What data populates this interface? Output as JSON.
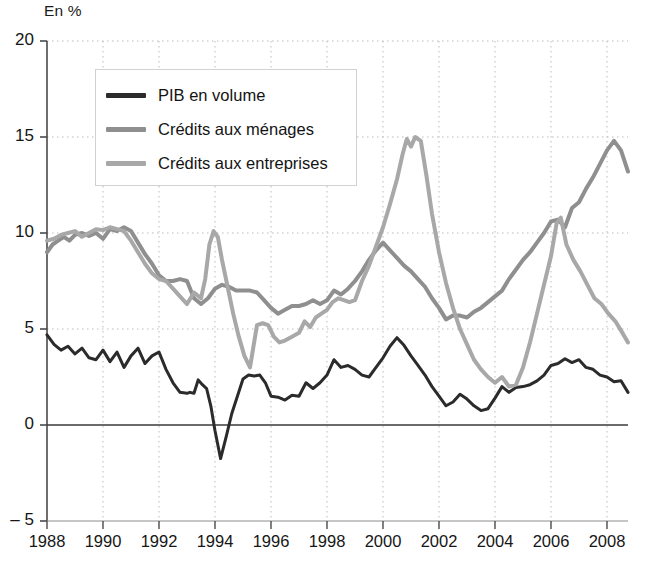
{
  "axis_unit_label": "En %",
  "legend": {
    "items": [
      {
        "label": "PIB en volume",
        "color": "#2b2b2b"
      },
      {
        "label": "Crédits aux ménages",
        "color": "#8f8f8f"
      },
      {
        "label": "Crédits aux entreprises",
        "color": "#a8a8a8"
      }
    ]
  },
  "source_note": "",
  "chart_data": {
    "type": "line",
    "title": "",
    "subtitle": "",
    "xlabel": "",
    "ylabel": "En %",
    "xlim": [
      1988,
      2008.75
    ],
    "ylim": [
      -5,
      20
    ],
    "yticks": [
      -5,
      0,
      5,
      10,
      15,
      20
    ],
    "ytick_labels": [
      "– 5",
      "0",
      "5",
      "10",
      "15",
      "20"
    ],
    "xticks": [
      1988,
      1990,
      1992,
      1994,
      1996,
      1998,
      2000,
      2002,
      2004,
      2006,
      2008
    ],
    "xtick_labels": [
      "1988",
      "1990",
      "1992",
      "1994",
      "1996",
      "1998",
      "2000",
      "2002",
      "2004",
      "2006",
      "2008"
    ],
    "grid": true,
    "grid_style": "dotted",
    "zero_line": true,
    "legend_position": "upper-left-inset",
    "series": [
      {
        "name": "PIB en volume",
        "color": "#2b2b2b",
        "width": 3.0,
        "points": [
          [
            1988.0,
            4.7
          ],
          [
            1988.25,
            4.2
          ],
          [
            1988.5,
            3.9
          ],
          [
            1988.75,
            4.1
          ],
          [
            1989.0,
            3.7
          ],
          [
            1989.25,
            4.0
          ],
          [
            1989.5,
            3.5
          ],
          [
            1989.75,
            3.4
          ],
          [
            1990.0,
            3.9
          ],
          [
            1990.25,
            3.3
          ],
          [
            1990.5,
            3.8
          ],
          [
            1990.75,
            3.0
          ],
          [
            1991.0,
            3.6
          ],
          [
            1991.25,
            4.0
          ],
          [
            1991.5,
            3.2
          ],
          [
            1991.75,
            3.6
          ],
          [
            1992.0,
            3.8
          ],
          [
            1992.25,
            2.9
          ],
          [
            1992.5,
            2.2
          ],
          [
            1992.75,
            1.7
          ],
          [
            1993.0,
            1.65
          ],
          [
            1993.1,
            1.7
          ],
          [
            1993.25,
            1.65
          ],
          [
            1993.4,
            2.35
          ],
          [
            1993.55,
            2.1
          ],
          [
            1993.7,
            1.9
          ],
          [
            1993.85,
            1.0
          ],
          [
            1994.0,
            -0.3
          ],
          [
            1994.2,
            -1.75
          ],
          [
            1994.4,
            -0.6
          ],
          [
            1994.6,
            0.6
          ],
          [
            1994.8,
            1.5
          ],
          [
            1995.0,
            2.4
          ],
          [
            1995.2,
            2.6
          ],
          [
            1995.4,
            2.55
          ],
          [
            1995.6,
            2.6
          ],
          [
            1995.8,
            2.2
          ],
          [
            1996.0,
            1.5
          ],
          [
            1996.25,
            1.45
          ],
          [
            1996.5,
            1.3
          ],
          [
            1996.75,
            1.55
          ],
          [
            1997.0,
            1.5
          ],
          [
            1997.25,
            2.2
          ],
          [
            1997.5,
            1.9
          ],
          [
            1997.75,
            2.2
          ],
          [
            1998.0,
            2.6
          ],
          [
            1998.25,
            3.4
          ],
          [
            1998.5,
            3.0
          ],
          [
            1998.75,
            3.1
          ],
          [
            1999.0,
            2.9
          ],
          [
            1999.25,
            2.6
          ],
          [
            1999.5,
            2.5
          ],
          [
            1999.75,
            3.0
          ],
          [
            2000.0,
            3.5
          ],
          [
            2000.25,
            4.1
          ],
          [
            2000.5,
            4.55
          ],
          [
            2000.75,
            4.15
          ],
          [
            2001.0,
            3.6
          ],
          [
            2001.25,
            3.1
          ],
          [
            2001.5,
            2.6
          ],
          [
            2001.75,
            2.0
          ],
          [
            2002.0,
            1.5
          ],
          [
            2002.25,
            1.0
          ],
          [
            2002.5,
            1.2
          ],
          [
            2002.75,
            1.6
          ],
          [
            2003.0,
            1.35
          ],
          [
            2003.25,
            1.0
          ],
          [
            2003.5,
            0.75
          ],
          [
            2003.75,
            0.85
          ],
          [
            2004.0,
            1.4
          ],
          [
            2004.25,
            2.0
          ],
          [
            2004.5,
            1.7
          ],
          [
            2004.75,
            1.95
          ],
          [
            2005.0,
            2.0
          ],
          [
            2005.25,
            2.1
          ],
          [
            2005.5,
            2.3
          ],
          [
            2005.75,
            2.6
          ],
          [
            2006.0,
            3.1
          ],
          [
            2006.25,
            3.2
          ],
          [
            2006.5,
            3.45
          ],
          [
            2006.75,
            3.25
          ],
          [
            2007.0,
            3.4
          ],
          [
            2007.25,
            3.0
          ],
          [
            2007.5,
            2.9
          ],
          [
            2007.75,
            2.6
          ],
          [
            2008.0,
            2.5
          ],
          [
            2008.25,
            2.25
          ],
          [
            2008.5,
            2.3
          ],
          [
            2008.75,
            1.7
          ]
        ]
      },
      {
        "name": "Crédits aux ménages",
        "color": "#8f8f8f",
        "width": 4.0,
        "points": [
          [
            1988.0,
            9.0
          ],
          [
            1988.2,
            9.4
          ],
          [
            1988.4,
            9.6
          ],
          [
            1988.6,
            9.8
          ],
          [
            1988.8,
            9.6
          ],
          [
            1989.0,
            9.9
          ],
          [
            1989.25,
            10.0
          ],
          [
            1989.5,
            9.85
          ],
          [
            1989.75,
            10.0
          ],
          [
            1990.0,
            9.7
          ],
          [
            1990.25,
            10.2
          ],
          [
            1990.5,
            10.1
          ],
          [
            1990.75,
            10.3
          ],
          [
            1991.0,
            10.1
          ],
          [
            1991.25,
            9.5
          ],
          [
            1991.5,
            8.9
          ],
          [
            1991.75,
            8.4
          ],
          [
            1992.0,
            7.8
          ],
          [
            1992.25,
            7.5
          ],
          [
            1992.5,
            7.5
          ],
          [
            1992.75,
            7.6
          ],
          [
            1993.0,
            7.5
          ],
          [
            1993.25,
            6.6
          ],
          [
            1993.5,
            6.3
          ],
          [
            1993.75,
            6.6
          ],
          [
            1994.0,
            7.1
          ],
          [
            1994.25,
            7.3
          ],
          [
            1994.5,
            7.2
          ],
          [
            1994.75,
            7.0
          ],
          [
            1995.0,
            7.0
          ],
          [
            1995.25,
            7.0
          ],
          [
            1995.5,
            6.9
          ],
          [
            1995.75,
            6.5
          ],
          [
            1996.0,
            6.1
          ],
          [
            1996.25,
            5.8
          ],
          [
            1996.5,
            6.0
          ],
          [
            1996.75,
            6.2
          ],
          [
            1997.0,
            6.2
          ],
          [
            1997.25,
            6.3
          ],
          [
            1997.5,
            6.5
          ],
          [
            1997.75,
            6.3
          ],
          [
            1998.0,
            6.5
          ],
          [
            1998.25,
            7.0
          ],
          [
            1998.5,
            6.8
          ],
          [
            1998.75,
            7.1
          ],
          [
            1999.0,
            7.5
          ],
          [
            1999.25,
            8.0
          ],
          [
            1999.5,
            8.6
          ],
          [
            1999.75,
            9.1
          ],
          [
            2000.0,
            9.5
          ],
          [
            2000.25,
            9.1
          ],
          [
            2000.5,
            8.7
          ],
          [
            2000.75,
            8.3
          ],
          [
            2001.0,
            8.0
          ],
          [
            2001.25,
            7.6
          ],
          [
            2001.5,
            7.2
          ],
          [
            2001.75,
            6.6
          ],
          [
            2002.0,
            6.1
          ],
          [
            2002.25,
            5.5
          ],
          [
            2002.5,
            5.7
          ],
          [
            2002.75,
            5.7
          ],
          [
            2003.0,
            5.6
          ],
          [
            2003.25,
            5.9
          ],
          [
            2003.5,
            6.1
          ],
          [
            2003.75,
            6.4
          ],
          [
            2004.0,
            6.7
          ],
          [
            2004.25,
            7.0
          ],
          [
            2004.5,
            7.6
          ],
          [
            2004.75,
            8.1
          ],
          [
            2005.0,
            8.6
          ],
          [
            2005.25,
            9.0
          ],
          [
            2005.5,
            9.5
          ],
          [
            2005.75,
            10.0
          ],
          [
            2006.0,
            10.6
          ],
          [
            2006.25,
            10.7
          ],
          [
            2006.5,
            10.3
          ],
          [
            2006.75,
            11.3
          ],
          [
            2007.0,
            11.6
          ],
          [
            2007.25,
            12.3
          ],
          [
            2007.5,
            12.9
          ],
          [
            2007.75,
            13.6
          ],
          [
            2008.0,
            14.3
          ],
          [
            2008.25,
            14.8
          ],
          [
            2008.5,
            14.3
          ],
          [
            2008.75,
            13.2
          ]
        ]
      },
      {
        "name": "Crédits aux entreprises",
        "color": "#a8a8a8",
        "width": 4.0,
        "points": [
          [
            1988.0,
            9.6
          ],
          [
            1988.25,
            9.7
          ],
          [
            1988.5,
            9.9
          ],
          [
            1988.75,
            10.0
          ],
          [
            1989.0,
            10.1
          ],
          [
            1989.25,
            9.8
          ],
          [
            1989.5,
            10.0
          ],
          [
            1989.75,
            10.2
          ],
          [
            1990.0,
            10.15
          ],
          [
            1990.25,
            10.3
          ],
          [
            1990.5,
            10.2
          ],
          [
            1990.75,
            10.1
          ],
          [
            1991.0,
            9.6
          ],
          [
            1991.25,
            9.0
          ],
          [
            1991.5,
            8.4
          ],
          [
            1991.75,
            7.9
          ],
          [
            1992.0,
            7.6
          ],
          [
            1992.25,
            7.5
          ],
          [
            1992.5,
            7.1
          ],
          [
            1992.75,
            6.7
          ],
          [
            1993.0,
            6.3
          ],
          [
            1993.25,
            6.9
          ],
          [
            1993.5,
            6.6
          ],
          [
            1993.65,
            7.6
          ],
          [
            1993.8,
            9.4
          ],
          [
            1993.95,
            10.1
          ],
          [
            1994.1,
            9.8
          ],
          [
            1994.25,
            8.6
          ],
          [
            1994.45,
            7.2
          ],
          [
            1994.65,
            5.8
          ],
          [
            1994.85,
            4.6
          ],
          [
            1995.05,
            3.6
          ],
          [
            1995.25,
            3.0
          ],
          [
            1995.5,
            5.2
          ],
          [
            1995.7,
            5.3
          ],
          [
            1995.9,
            5.2
          ],
          [
            1996.1,
            4.6
          ],
          [
            1996.3,
            4.3
          ],
          [
            1996.5,
            4.4
          ],
          [
            1996.75,
            4.6
          ],
          [
            1997.0,
            4.8
          ],
          [
            1997.2,
            5.4
          ],
          [
            1997.4,
            5.1
          ],
          [
            1997.6,
            5.6
          ],
          [
            1997.8,
            5.8
          ],
          [
            1998.0,
            6.0
          ],
          [
            1998.2,
            6.4
          ],
          [
            1998.4,
            6.6
          ],
          [
            1998.6,
            6.5
          ],
          [
            1998.8,
            6.4
          ],
          [
            1999.0,
            6.5
          ],
          [
            1999.25,
            7.5
          ],
          [
            1999.5,
            8.3
          ],
          [
            1999.75,
            9.3
          ],
          [
            2000.0,
            10.3
          ],
          [
            2000.25,
            11.5
          ],
          [
            2000.5,
            12.8
          ],
          [
            2000.7,
            14.1
          ],
          [
            2000.85,
            14.9
          ],
          [
            2001.0,
            14.5
          ],
          [
            2001.15,
            15.0
          ],
          [
            2001.35,
            14.8
          ],
          [
            2001.55,
            13.0
          ],
          [
            2001.75,
            11.0
          ],
          [
            2002.0,
            9.0
          ],
          [
            2002.25,
            7.4
          ],
          [
            2002.5,
            6.1
          ],
          [
            2002.75,
            5.0
          ],
          [
            2003.0,
            4.2
          ],
          [
            2003.25,
            3.4
          ],
          [
            2003.5,
            2.9
          ],
          [
            2003.75,
            2.5
          ],
          [
            2004.0,
            2.2
          ],
          [
            2004.25,
            2.5
          ],
          [
            2004.5,
            2.0
          ],
          [
            2004.75,
            2.1
          ],
          [
            2005.0,
            3.0
          ],
          [
            2005.25,
            4.3
          ],
          [
            2005.5,
            5.8
          ],
          [
            2005.75,
            7.3
          ],
          [
            2006.0,
            8.8
          ],
          [
            2006.2,
            10.5
          ],
          [
            2006.35,
            10.8
          ],
          [
            2006.55,
            9.4
          ],
          [
            2006.8,
            8.6
          ],
          [
            2007.05,
            8.0
          ],
          [
            2007.3,
            7.3
          ],
          [
            2007.55,
            6.6
          ],
          [
            2007.8,
            6.3
          ],
          [
            2008.05,
            5.8
          ],
          [
            2008.3,
            5.4
          ],
          [
            2008.55,
            4.8
          ],
          [
            2008.75,
            4.3
          ]
        ]
      }
    ]
  }
}
